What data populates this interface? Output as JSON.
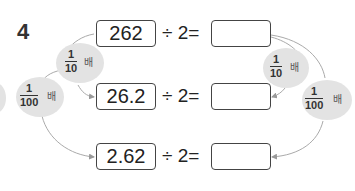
{
  "problem_number": "4",
  "rows": [
    {
      "dividend": "262",
      "operator": "÷",
      "divisor": "2",
      "equals": "=",
      "answer": ""
    },
    {
      "dividend": "26.2",
      "operator": "÷",
      "divisor": "2",
      "equals": "=",
      "answer": ""
    },
    {
      "dividend": "2.62",
      "operator": "÷",
      "divisor": "2",
      "equals": "=",
      "answer": ""
    }
  ],
  "labels": {
    "left_tenth": {
      "numerator": "1",
      "denominator": "10",
      "unit": "배"
    },
    "left_hundredth": {
      "numerator": "1",
      "denominator": "100",
      "unit": "배"
    },
    "right_tenth": {
      "numerator": "1",
      "denominator": "10",
      "unit": "배"
    },
    "right_hundredth": {
      "numerator": "1",
      "denominator": "100",
      "unit": "배"
    }
  }
}
